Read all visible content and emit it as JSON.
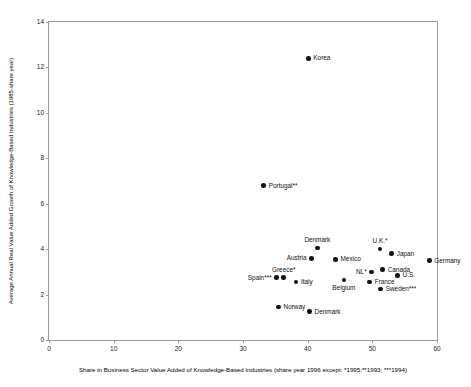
{
  "chart_data": {
    "type": "scatter",
    "title": "",
    "xlabel": "Share in Business Sector Value Added of Knowledge-Based Industries (share year 1996 except: *1995;**1993; ***1994)",
    "ylabel": "Average Annual Real Value Added Growth of Knowledge-Based Industries (1985-share year)",
    "xlim": [
      0,
      60
    ],
    "ylim": [
      0,
      14
    ],
    "xticks": [
      0,
      10,
      20,
      30,
      40,
      50,
      60
    ],
    "yticks": [
      0,
      2,
      4,
      6,
      8,
      10,
      12,
      14
    ],
    "grid": false,
    "legend": "none",
    "marker": "filled-circle",
    "marker_color": "#111111",
    "frame_color": "#9a9a9a",
    "points": [
      {
        "label": "Korea",
        "x": 40.1,
        "y": 12.4,
        "label_pos": "right"
      },
      {
        "label": "Portugal**",
        "x": 33.2,
        "y": 6.8,
        "label_pos": "right"
      },
      {
        "label": "Denmark",
        "x": 41.5,
        "y": 4.05,
        "label_pos": "above"
      },
      {
        "label": "Austria",
        "x": 40.6,
        "y": 3.6,
        "label_pos": "left"
      },
      {
        "label": "Mexico",
        "x": 44.3,
        "y": 3.55,
        "label_pos": "right"
      },
      {
        "label": "U.K.*",
        "x": 51.2,
        "y": 4.0,
        "label_pos": "above"
      },
      {
        "label": "Japan",
        "x": 53.0,
        "y": 3.8,
        "label_pos": "right"
      },
      {
        "label": "Germany",
        "x": 58.8,
        "y": 3.5,
        "label_pos": "right"
      },
      {
        "label": "Canada",
        "x": 51.6,
        "y": 3.1,
        "label_pos": "right"
      },
      {
        "label": "NL*",
        "x": 49.9,
        "y": 3.0,
        "label_pos": "left"
      },
      {
        "label": "U.S.",
        "x": 53.9,
        "y": 2.85,
        "label_pos": "right"
      },
      {
        "label": "Spain***",
        "x": 35.2,
        "y": 2.75,
        "label_pos": "left"
      },
      {
        "label": "Greece*",
        "x": 36.3,
        "y": 2.75,
        "label_pos": "above"
      },
      {
        "label": "Italy",
        "x": 38.2,
        "y": 2.55,
        "label_pos": "right"
      },
      {
        "label": "Belgium",
        "x": 45.6,
        "y": 2.65,
        "label_pos": "below"
      },
      {
        "label": "France",
        "x": 49.6,
        "y": 2.55,
        "label_pos": "right"
      },
      {
        "label": "Sweden***",
        "x": 51.3,
        "y": 2.25,
        "label_pos": "right"
      },
      {
        "label": "Norway",
        "x": 35.5,
        "y": 1.45,
        "label_pos": "right"
      },
      {
        "label": "Denmark",
        "x": 40.3,
        "y": 1.25,
        "label_pos": "right"
      }
    ]
  }
}
